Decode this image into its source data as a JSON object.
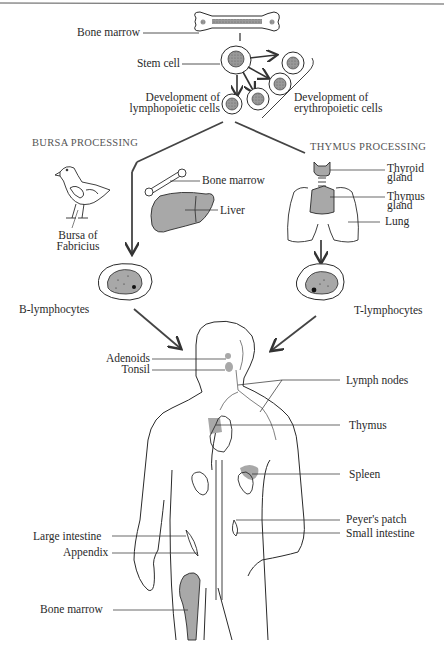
{
  "diagram": {
    "top": {
      "bone_marrow": "Bone marrow",
      "stem_cell": "Stem cell",
      "lympho_dev_line1": "Development of",
      "lympho_dev_line2": "lymphopoietic cells",
      "erythro_dev_line1": "Development of",
      "erythro_dev_line2": "erythropoietic cells"
    },
    "bursa": {
      "heading": "BURSA PROCESSING",
      "bursa_line1": "Bursa of",
      "bursa_line2": "Fabricius",
      "bone_marrow": "Bone marrow",
      "liver": "Liver",
      "cell_label": "B-lymphocytes"
    },
    "thymus": {
      "heading": "THYMUS PROCESSING",
      "thyroid_line1": "Thyroid",
      "thyroid_line2": "gland",
      "thymus_line1": "Thymus",
      "thymus_line2": "gland",
      "lung": "Lung",
      "cell_label": "T-lymphocytes"
    },
    "body_left": {
      "adenoids": "Adenoids",
      "tonsil": "Tonsil",
      "large_intestine": "Large intestine",
      "appendix": "Appendix",
      "bone_marrow": "Bone marrow"
    },
    "body_right": {
      "lymph_nodes": "Lymph nodes",
      "thymus": "Thymus",
      "spleen": "Spleen",
      "peyers_patch": "Peyer's patch",
      "small_intestine": "Small intestine"
    },
    "colors": {
      "line": "#2a2a2a",
      "organ_fill": "#a8a8a8",
      "nucleus_fill": "#9a9a9a",
      "arrow": "#444444"
    }
  }
}
